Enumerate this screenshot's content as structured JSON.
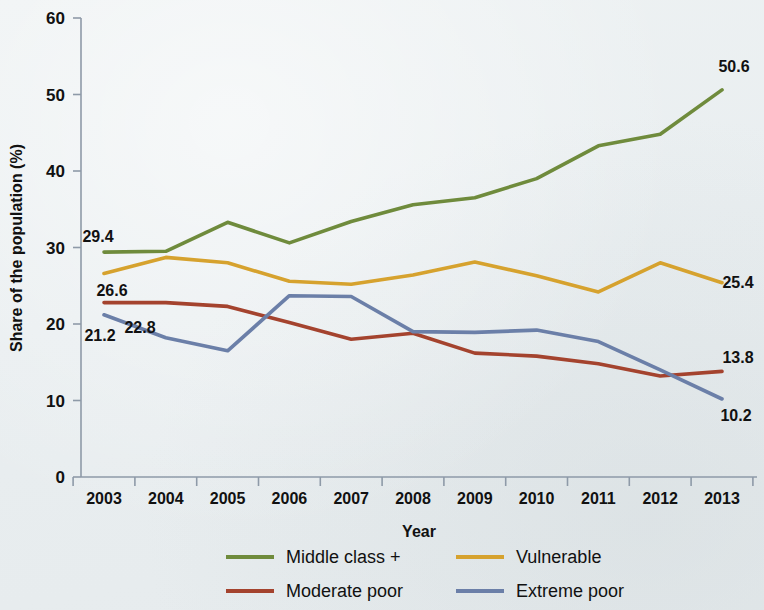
{
  "chart_data": {
    "type": "line",
    "title": "",
    "xlabel": "Year",
    "ylabel": "Share of the population (%)",
    "x": [
      2003,
      2004,
      2005,
      2006,
      2007,
      2008,
      2009,
      2010,
      2011,
      2012,
      2013
    ],
    "categories": [
      "2003",
      "2004",
      "2005",
      "2006",
      "2007",
      "2008",
      "2009",
      "2010",
      "2011",
      "2012",
      "2013"
    ],
    "ylim": [
      0,
      60
    ],
    "yticks": [
      0,
      10,
      20,
      30,
      40,
      50,
      60
    ],
    "grid": false,
    "legend_position": "bottom",
    "series": [
      {
        "name": "Middle class +",
        "color": "#6f8b3c",
        "values": [
          29.4,
          29.5,
          33.3,
          30.6,
          33.4,
          35.6,
          36.5,
          39.0,
          43.3,
          44.8,
          50.6
        ],
        "start_label": "29.4",
        "end_label": "50.6"
      },
      {
        "name": "Vulnerable",
        "color": "#d6a22e",
        "values": [
          26.6,
          28.7,
          28.0,
          25.6,
          25.2,
          26.4,
          28.1,
          26.3,
          24.2,
          28.0,
          25.4
        ],
        "start_label": "26.6",
        "end_label": "25.4"
      },
      {
        "name": "Moderate poor",
        "color": "#a4432e",
        "values": [
          22.8,
          22.8,
          22.3,
          20.2,
          18.0,
          18.8,
          16.2,
          15.8,
          14.8,
          13.2,
          13.8
        ],
        "start_label": "22.8",
        "end_label": "13.8"
      },
      {
        "name": "Extreme poor",
        "color": "#6b7fa8",
        "values": [
          21.2,
          18.2,
          16.5,
          23.7,
          23.6,
          19.0,
          18.9,
          19.2,
          17.7,
          14.0,
          10.2
        ],
        "start_label": "21.2",
        "end_label": "10.2"
      }
    ],
    "annotations": {
      "left": [
        {
          "text": "29.4",
          "series": "Middle class +"
        },
        {
          "text": "26.6",
          "series": "Vulnerable"
        },
        {
          "text": "22.8",
          "series": "Moderate poor"
        },
        {
          "text": "21.2",
          "series": "Extreme poor"
        }
      ],
      "right": [
        {
          "text": "50.6",
          "series": "Middle class +"
        },
        {
          "text": "25.4",
          "series": "Vulnerable"
        },
        {
          "text": "13.8",
          "series": "Moderate poor"
        },
        {
          "text": "10.2",
          "series": "Extreme poor"
        }
      ]
    }
  },
  "axis": {
    "y_title": "Share of the population (%)",
    "x_title": "Year",
    "y_ticks": [
      "60",
      "50",
      "40",
      "30",
      "20",
      "10",
      "0"
    ],
    "x_ticks": [
      "2003",
      "2004",
      "2005",
      "2006",
      "2007",
      "2008",
      "2009",
      "2010",
      "2011",
      "2012",
      "2013"
    ]
  },
  "labels": {
    "left_0": "29.4",
    "left_1": "26.6",
    "left_2": "22.8",
    "left_3": "21.2",
    "right_0": "50.6",
    "right_1": "25.4",
    "right_2": "13.8",
    "right_3": "10.2"
  },
  "legend": {
    "items": [
      {
        "label": "Middle class +",
        "color": "#6f8b3c"
      },
      {
        "label": "Vulnerable",
        "color": "#d6a22e"
      },
      {
        "label": "Moderate poor",
        "color": "#a4432e"
      },
      {
        "label": "Extreme poor",
        "color": "#6b7fa8"
      }
    ]
  },
  "colors": {
    "background": "#edf1f2",
    "axis": "#8e9aa8",
    "text": "#111111",
    "middle_class": "#6f8b3c",
    "vulnerable": "#d6a22e",
    "moderate_poor": "#a4432e",
    "extreme_poor": "#6b7fa8"
  }
}
